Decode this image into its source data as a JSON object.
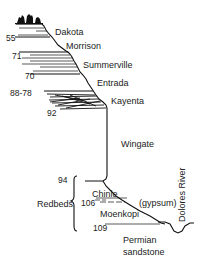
{
  "diagram": {
    "type": "geologic cross-section",
    "formations": [
      {
        "name": "Dakota",
        "x": 55,
        "y": 28
      },
      {
        "name": "Morrison",
        "x": 66,
        "y": 42
      },
      {
        "name": "Summerville",
        "x": 83,
        "y": 61
      },
      {
        "name": "Entrada",
        "x": 97,
        "y": 79
      },
      {
        "name": "Kayenta",
        "x": 111,
        "y": 97
      },
      {
        "name": "Wingate",
        "x": 121,
        "y": 140
      },
      {
        "name": "Chinle",
        "x": 92,
        "y": 190
      },
      {
        "name": "(gypsum)",
        "x": 139,
        "y": 199
      },
      {
        "name": "Moenkopi",
        "x": 100,
        "y": 210
      },
      {
        "name": "Permian",
        "x": 123,
        "y": 236
      },
      {
        "name": "sandstone",
        "x": 123,
        "y": 248
      }
    ],
    "group_label": {
      "name": "Redbeds",
      "x": 37,
      "y": 200
    },
    "river_label": {
      "name": "Dolores River",
      "x": 178,
      "y": 222
    },
    "numbers": [
      {
        "value": "55",
        "x": 6,
        "y": 34
      },
      {
        "value": "71",
        "x": 12,
        "y": 52
      },
      {
        "value": "70",
        "x": 25,
        "y": 72
      },
      {
        "value": "88-78",
        "x": 10,
        "y": 89
      },
      {
        "value": "92",
        "x": 47,
        "y": 109
      },
      {
        "value": "94",
        "x": 58,
        "y": 176
      },
      {
        "value": "106",
        "x": 81,
        "y": 199
      },
      {
        "value": "109",
        "x": 93,
        "y": 224
      }
    ],
    "colors": {
      "line": "#111111",
      "text": "#222222",
      "background": "#ffffff"
    }
  }
}
